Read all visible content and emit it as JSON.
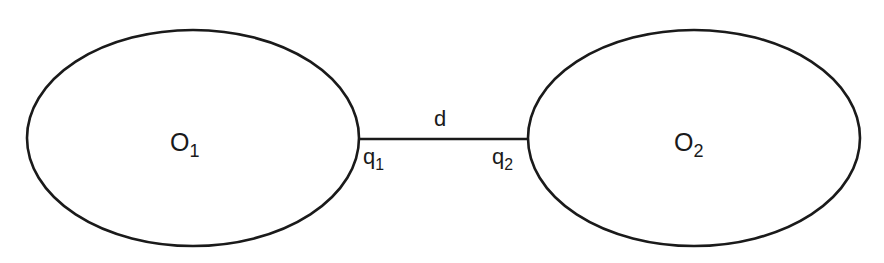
{
  "diagram": {
    "stroke_color": "#1a1a1a",
    "background": "#ffffff",
    "nodes": [
      {
        "id": "O1",
        "base": "O",
        "sub": "1",
        "shape": "ellipse",
        "cx": 193,
        "cy": 138,
        "rx": 166,
        "ry": 108
      },
      {
        "id": "O2",
        "base": "O",
        "sub": "2",
        "shape": "ellipse",
        "cx": 694,
        "cy": 138,
        "rx": 166,
        "ry": 108
      }
    ],
    "edge": {
      "label": "d",
      "from": "O1",
      "to": "O2",
      "x1": 359,
      "y1": 139,
      "x2": 528,
      "y2": 139,
      "endpoint_labels": [
        {
          "base": "q",
          "sub": "1"
        },
        {
          "base": "q",
          "sub": "2"
        }
      ]
    }
  }
}
